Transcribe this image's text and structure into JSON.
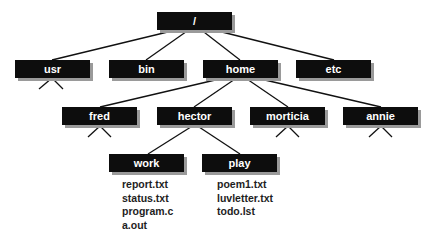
{
  "diagram": {
    "nodes": {
      "root": {
        "label": "/",
        "x": 157,
        "y": 12
      },
      "usr": {
        "label": "usr",
        "x": 15,
        "y": 60
      },
      "bin": {
        "label": "bin",
        "x": 109,
        "y": 60
      },
      "home": {
        "label": "home",
        "x": 203,
        "y": 60
      },
      "etc": {
        "label": "etc",
        "x": 296,
        "y": 60
      },
      "fred": {
        "label": "fred",
        "x": 62,
        "y": 107
      },
      "hector": {
        "label": "hector",
        "x": 157,
        "y": 107
      },
      "morticia": {
        "label": "morticia",
        "x": 250,
        "y": 107
      },
      "annie": {
        "label": "annie",
        "x": 343,
        "y": 107
      },
      "work": {
        "label": "work",
        "x": 109,
        "y": 154
      },
      "play": {
        "label": "play",
        "x": 202,
        "y": 154
      }
    },
    "edges": [
      [
        "root",
        "usr"
      ],
      [
        "root",
        "bin"
      ],
      [
        "root",
        "home"
      ],
      [
        "root",
        "etc"
      ],
      [
        "home",
        "fred"
      ],
      [
        "home",
        "hector"
      ],
      [
        "home",
        "morticia"
      ],
      [
        "home",
        "annie"
      ],
      [
        "hector",
        "work"
      ],
      [
        "hector",
        "play"
      ]
    ],
    "stubs": [
      "usr",
      "fred",
      "morticia",
      "annie"
    ],
    "files": {
      "work": [
        "report.txt",
        "status.txt",
        "program.c",
        "a.out"
      ],
      "play": [
        "poem1.txt",
        "luvletter.txt",
        "todo.lst"
      ]
    },
    "colors": {
      "box": "#0d0d0d",
      "shadow": "#9a9a9a",
      "text": "#ffffff",
      "line": "#111111",
      "file_text": "#1e1e1e"
    }
  }
}
